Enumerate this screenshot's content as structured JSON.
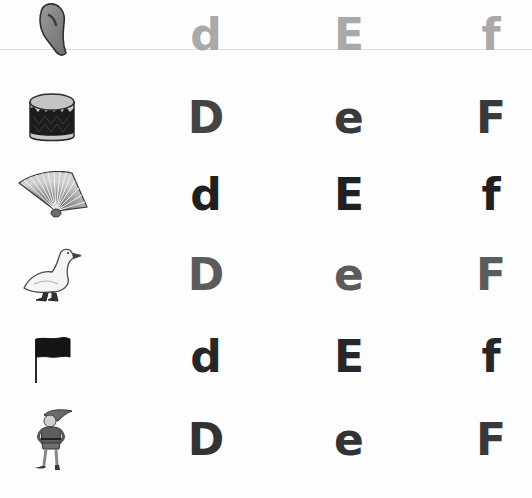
{
  "worksheet": {
    "guide_line_y": 49,
    "rows": [
      {
        "picture": "ear",
        "picture_icon": "ear-icon",
        "center_y": 30,
        "letters": [
          "d",
          "E",
          "f"
        ],
        "color": "#a9a9a9"
      },
      {
        "picture": "drum",
        "picture_icon": "drum-icon",
        "center_y": 118,
        "letters": [
          "D",
          "e",
          "F"
        ],
        "color": "#3d3d3d"
      },
      {
        "picture": "fan",
        "picture_icon": "fan-icon",
        "center_y": 195,
        "letters": [
          "d",
          "E",
          "f"
        ],
        "color": "#202020"
      },
      {
        "picture": "goose",
        "picture_icon": "goose-icon",
        "center_y": 275,
        "letters": [
          "D",
          "e",
          "F"
        ],
        "color": "#5b5b5b"
      },
      {
        "picture": "flag",
        "picture_icon": "flag-icon",
        "center_y": 357,
        "letters": [
          "d",
          "E",
          "f"
        ],
        "color": "#272727"
      },
      {
        "picture": "elf",
        "picture_icon": "elf-icon",
        "center_y": 440,
        "letters": [
          "D",
          "e",
          "F"
        ],
        "color": "#333333"
      }
    ]
  }
}
